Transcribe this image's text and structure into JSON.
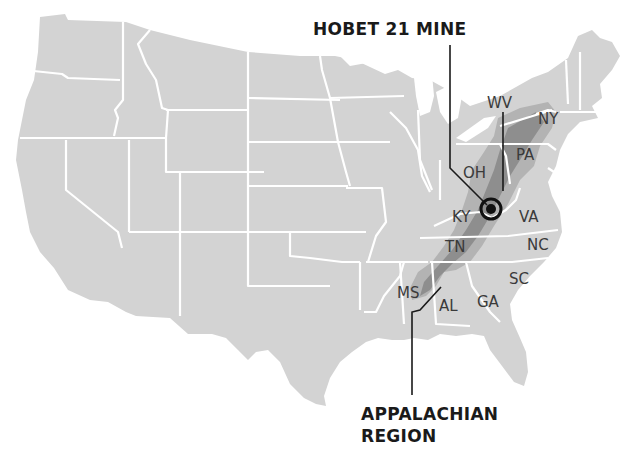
{
  "map": {
    "title": "HOBET 21 MINE",
    "region_label_line1": "APPALACHIAN",
    "region_label_line2": "REGION",
    "colors": {
      "land": "#d3d3d3",
      "state_border": "#ffffff",
      "appalachian_mid": "#b3b3b3",
      "appalachian_dark": "#8e8e8e",
      "text": "#1a1a1a",
      "background": "#ffffff"
    },
    "marker": {
      "name": "Hobet 21 Mine",
      "icon": "target-bullseye-icon",
      "x": 490,
      "y": 208
    },
    "state_labels": [
      {
        "abbr": "WV",
        "x": 487,
        "y": 108
      },
      {
        "abbr": "NY",
        "x": 538,
        "y": 124
      },
      {
        "abbr": "PA",
        "x": 516,
        "y": 160
      },
      {
        "abbr": "OH",
        "x": 463,
        "y": 178
      },
      {
        "abbr": "KY",
        "x": 452,
        "y": 222
      },
      {
        "abbr": "VA",
        "x": 519,
        "y": 222
      },
      {
        "abbr": "TN",
        "x": 445,
        "y": 252
      },
      {
        "abbr": "NC",
        "x": 527,
        "y": 250
      },
      {
        "abbr": "SC",
        "x": 509,
        "y": 284
      },
      {
        "abbr": "MS",
        "x": 397,
        "y": 298
      },
      {
        "abbr": "AL",
        "x": 439,
        "y": 311
      },
      {
        "abbr": "GA",
        "x": 477,
        "y": 307
      }
    ]
  }
}
